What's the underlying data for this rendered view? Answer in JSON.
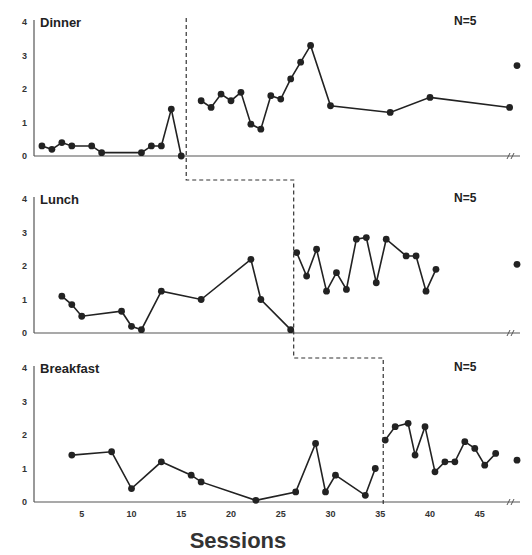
{
  "chart_data": {
    "type": "line",
    "title": "",
    "xlabel": "Sessions",
    "ylabel": "",
    "xlim": [
      0,
      48
    ],
    "ylim": [
      0,
      4
    ],
    "x_ticks": [
      5,
      10,
      15,
      20,
      25,
      30,
      35,
      40,
      45
    ],
    "y_ticks": [
      0,
      1,
      2,
      3,
      4
    ],
    "grid": false,
    "layout": "three stacked panels (multiple-baseline design)",
    "panels": [
      {
        "name": "Dinner",
        "n_label": "N=5",
        "phase_change_after_session": 15.5,
        "baseline": {
          "x": [
            1,
            2,
            3,
            4,
            6,
            7,
            11,
            12,
            13,
            14,
            15
          ],
          "y": [
            0.3,
            0.2,
            0.4,
            0.3,
            0.3,
            0.1,
            0.1,
            0.3,
            0.3,
            1.4,
            0.0
          ]
        },
        "intervention": {
          "x": [
            17,
            18,
            19,
            20,
            21,
            22,
            23,
            24,
            25,
            26,
            27,
            28,
            30,
            36,
            40,
            48
          ],
          "y": [
            1.65,
            1.45,
            1.85,
            1.65,
            1.9,
            0.95,
            0.8,
            1.8,
            1.7,
            2.3,
            2.8,
            3.3,
            1.5,
            1.3,
            1.75,
            1.45
          ]
        },
        "follow_up": {
          "y": 2.7
        }
      },
      {
        "name": "Lunch",
        "n_label": "N=5",
        "phase_change_after_session": 26.3,
        "baseline": {
          "x": [
            3,
            4,
            5,
            9,
            10,
            11,
            13,
            17,
            22,
            23,
            26
          ],
          "y": [
            1.1,
            0.85,
            0.5,
            0.65,
            0.2,
            0.1,
            1.25,
            1.0,
            2.2,
            1.0,
            0.1
          ]
        },
        "intervention": {
          "x": [
            26.6,
            27.6,
            28.6,
            29.6,
            30.6,
            31.6,
            32.6,
            33.6,
            34.6,
            35.6,
            37.6,
            38.6,
            39.6,
            40.6
          ],
          "y": [
            2.4,
            1.7,
            2.5,
            1.25,
            1.8,
            1.3,
            2.8,
            2.85,
            1.5,
            2.8,
            2.3,
            2.3,
            1.25,
            1.9
          ]
        },
        "follow_up": {
          "y": 2.05
        }
      },
      {
        "name": "Breakfast",
        "n_label": "N=5",
        "phase_change_after_session": 35.3,
        "baseline": {
          "x": [
            4,
            8,
            10,
            13,
            16,
            17,
            22.5,
            26.5,
            28.5,
            29.5,
            30.5,
            33.5,
            34.5
          ],
          "y": [
            1.4,
            1.5,
            0.4,
            1.2,
            0.8,
            0.6,
            0.05,
            0.3,
            1.75,
            0.3,
            0.8,
            0.2,
            1.0
          ]
        },
        "intervention": {
          "x": [
            35.5,
            36.5,
            37.8,
            38.5,
            39.5,
            40.5,
            41.5,
            42.5,
            43.5,
            44.5,
            45.5,
            46.6
          ],
          "y": [
            1.85,
            2.25,
            2.35,
            1.4,
            2.25,
            0.9,
            1.2,
            1.2,
            1.8,
            1.6,
            1.1,
            1.45
          ]
        },
        "follow_up": {
          "y": 1.25
        }
      }
    ]
  }
}
